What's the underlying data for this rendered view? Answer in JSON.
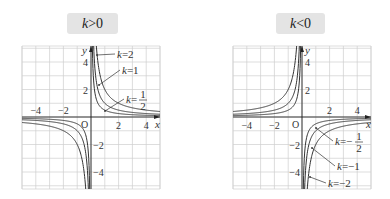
{
  "badges": {
    "left": {
      "var": "k",
      "op": ">",
      "val": "0"
    },
    "right": {
      "var": "k",
      "op": "<",
      "val": "0"
    }
  },
  "chart_data": [
    {
      "type": "line",
      "title": "k>0",
      "function": "y = k/x",
      "xlabel": "x",
      "ylabel": "y",
      "origin_label": "O",
      "xlim": [
        -5,
        5
      ],
      "ylim": [
        -5.2,
        5.2
      ],
      "grid": true,
      "x_ticks": [
        {
          "v": -4,
          "label": "−4"
        },
        {
          "v": -2,
          "label": "−2"
        },
        {
          "v": 2,
          "label": "2"
        },
        {
          "v": 4,
          "label": "4"
        }
      ],
      "y_ticks": [
        {
          "v": 4,
          "label": "4"
        },
        {
          "v": 2,
          "label": "2"
        },
        {
          "v": -2,
          "label": "−2"
        },
        {
          "v": -4,
          "label": "−4"
        }
      ],
      "series": [
        {
          "name": "k=2",
          "k": 2,
          "label": {
            "var": "k",
            "eq": "=",
            "num": "2",
            "den": ""
          }
        },
        {
          "name": "k=1",
          "k": 1,
          "label": {
            "var": "k",
            "eq": "=",
            "num": "1",
            "den": ""
          }
        },
        {
          "name": "k=1/2",
          "k": 0.5,
          "label": {
            "var": "k",
            "eq": "=",
            "num": "1",
            "den": "2"
          }
        }
      ]
    },
    {
      "type": "line",
      "title": "k<0",
      "function": "y = k/x",
      "xlabel": "x",
      "ylabel": "y",
      "origin_label": "O",
      "xlim": [
        -5,
        5
      ],
      "ylim": [
        -5.2,
        5.2
      ],
      "grid": true,
      "x_ticks": [
        {
          "v": -4,
          "label": "−4"
        },
        {
          "v": -2,
          "label": "−2"
        },
        {
          "v": 2,
          "label": "2"
        },
        {
          "v": 4,
          "label": "4"
        }
      ],
      "y_ticks": [
        {
          "v": 4,
          "label": "4"
        },
        {
          "v": 2,
          "label": "2"
        },
        {
          "v": -2,
          "label": "−2"
        },
        {
          "v": -4,
          "label": "−4"
        }
      ],
      "series": [
        {
          "name": "k=-1/2",
          "k": -0.5,
          "label": {
            "var": "k",
            "eq": "=−",
            "num": "1",
            "den": "2"
          }
        },
        {
          "name": "k=-1",
          "k": -1,
          "label": {
            "var": "k",
            "eq": "=−",
            "num": "1",
            "den": ""
          }
        },
        {
          "name": "k=-2",
          "k": -2,
          "label": {
            "var": "k",
            "eq": "=−",
            "num": "2",
            "den": ""
          }
        }
      ]
    }
  ]
}
